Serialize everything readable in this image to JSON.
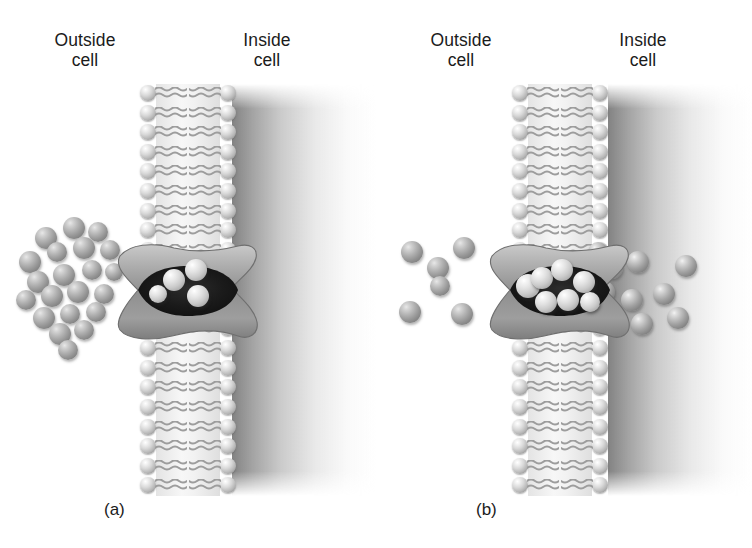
{
  "figure": {
    "type": "biology-diagram",
    "background_color": "#ffffff",
    "text_color": "#1b1b1b"
  },
  "panels": [
    {
      "id": "a",
      "caption": "(a)",
      "labels": {
        "outside": "Outside\ncell",
        "inside": "Inside\ncell"
      },
      "state": "Solute molecules accumulated outside the cell; transport protein channel open with a few molecules entering",
      "solute_count_outside": 21,
      "solute_count_in_channel": 4,
      "solute_count_inside": 0
    },
    {
      "id": "b",
      "caption": "(b)",
      "labels": {
        "outside": "Outside\ncell",
        "inside": "Inside\ncell"
      },
      "state": "Most solute molecules have crossed; channel filled and molecules dispersing into the cytoplasm",
      "solute_count_outside": 5,
      "solute_count_in_channel": 7,
      "solute_count_inside": 11
    }
  ],
  "membrane": {
    "name": "phospholipid bilayer",
    "leaflets": 2,
    "lipids_per_leaflet": 21,
    "head_label": "hydrophilic head",
    "tail_label": "hydrophobic tails",
    "head_color": "#d8d8d8",
    "tail_color": "#a9a9a9"
  },
  "protein": {
    "name": "transport protein",
    "shape": "hourglass channel",
    "body_color": "#9a9a9a",
    "pore_color": "#1e1e1e"
  },
  "solute": {
    "name": "solute molecule",
    "color": "#8e8e8e"
  },
  "cytoplasm": {
    "name": "cell interior",
    "gradient_from": "#787878",
    "gradient_to": "#ffffff"
  },
  "solutes_a_outside": [
    {
      "x": 46,
      "y": 238,
      "r": 11
    },
    {
      "x": 74,
      "y": 228,
      "r": 11
    },
    {
      "x": 98,
      "y": 232,
      "r": 10
    },
    {
      "x": 30,
      "y": 262,
      "r": 11
    },
    {
      "x": 57,
      "y": 252,
      "r": 10
    },
    {
      "x": 84,
      "y": 248,
      "r": 11
    },
    {
      "x": 110,
      "y": 250,
      "r": 10
    },
    {
      "x": 38,
      "y": 282,
      "r": 11
    },
    {
      "x": 64,
      "y": 275,
      "r": 11
    },
    {
      "x": 92,
      "y": 270,
      "r": 10
    },
    {
      "x": 114,
      "y": 272,
      "r": 9
    },
    {
      "x": 26,
      "y": 300,
      "r": 10
    },
    {
      "x": 52,
      "y": 296,
      "r": 11
    },
    {
      "x": 78,
      "y": 292,
      "r": 11
    },
    {
      "x": 104,
      "y": 294,
      "r": 10
    },
    {
      "x": 44,
      "y": 318,
      "r": 11
    },
    {
      "x": 70,
      "y": 314,
      "r": 10
    },
    {
      "x": 96,
      "y": 312,
      "r": 10
    },
    {
      "x": 60,
      "y": 334,
      "r": 11
    },
    {
      "x": 84,
      "y": 330,
      "r": 10
    },
    {
      "x": 68,
      "y": 350,
      "r": 10
    }
  ],
  "solutes_a_channel": [
    {
      "x": 62,
      "y": 40,
      "r": 11
    },
    {
      "x": 84,
      "y": 30,
      "r": 11
    },
    {
      "x": 86,
      "y": 56,
      "r": 11
    },
    {
      "x": 46,
      "y": 54,
      "r": 9
    }
  ],
  "solutes_b_outside": [
    {
      "x": 36,
      "y": 252,
      "r": 11
    },
    {
      "x": 62,
      "y": 268,
      "r": 11
    },
    {
      "x": 64,
      "y": 286,
      "r": 10
    },
    {
      "x": 88,
      "y": 248,
      "r": 11
    },
    {
      "x": 34,
      "y": 312,
      "r": 11
    },
    {
      "x": 86,
      "y": 314,
      "r": 11
    }
  ],
  "solutes_b_channel": [
    {
      "x": 44,
      "y": 46,
      "r": 12
    },
    {
      "x": 58,
      "y": 38,
      "r": 11
    },
    {
      "x": 78,
      "y": 30,
      "r": 11
    },
    {
      "x": 100,
      "y": 42,
      "r": 11
    },
    {
      "x": 62,
      "y": 62,
      "r": 11
    },
    {
      "x": 84,
      "y": 60,
      "r": 11
    },
    {
      "x": 106,
      "y": 62,
      "r": 10
    }
  ],
  "solutes_b_inside": [
    {
      "x": 236,
      "y": 268,
      "r": 11
    },
    {
      "x": 262,
      "y": 262,
      "r": 11
    },
    {
      "x": 310,
      "y": 266,
      "r": 11
    },
    {
      "x": 228,
      "y": 292,
      "r": 11
    },
    {
      "x": 256,
      "y": 300,
      "r": 11
    },
    {
      "x": 288,
      "y": 294,
      "r": 11
    },
    {
      "x": 234,
      "y": 318,
      "r": 11
    },
    {
      "x": 266,
      "y": 324,
      "r": 11
    },
    {
      "x": 302,
      "y": 318,
      "r": 11
    },
    {
      "x": 222,
      "y": 252,
      "r": 10
    },
    {
      "x": 210,
      "y": 310,
      "r": 10
    }
  ]
}
